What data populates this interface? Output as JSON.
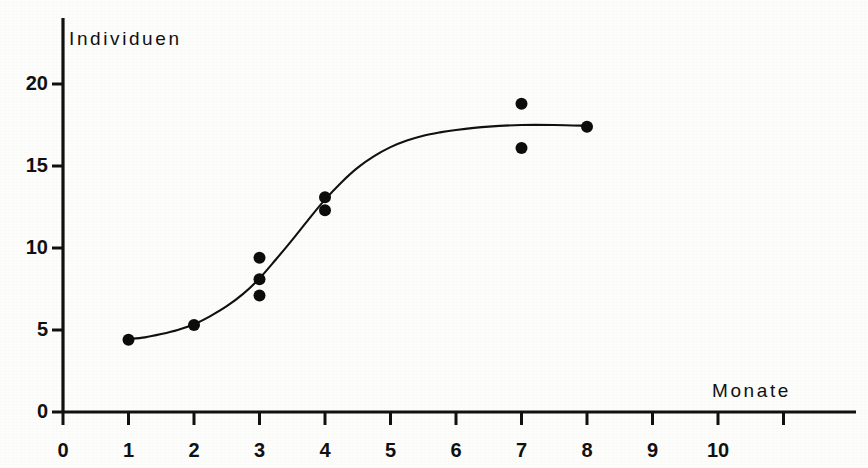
{
  "chart_data": {
    "type": "scatter",
    "title": "",
    "xlabel": "Monate",
    "ylabel": "Individuen",
    "xlim": [
      0,
      12.1
    ],
    "ylim": [
      0,
      22
    ],
    "grid": false,
    "legend": "none",
    "x_ticks": [
      0,
      1,
      2,
      3,
      4,
      5,
      6,
      7,
      8,
      9,
      10,
      11
    ],
    "x_tick_labels": [
      "0",
      "1",
      "2",
      "3",
      "4",
      "5",
      "6",
      "7",
      "8",
      "9",
      "10",
      ""
    ],
    "y_ticks": [
      0,
      5,
      10,
      15,
      20
    ],
    "y_tick_labels": [
      "0",
      "5",
      "10",
      "15",
      "20"
    ],
    "points": [
      {
        "x": 1,
        "y": 4.4
      },
      {
        "x": 2,
        "y": 5.3
      },
      {
        "x": 3,
        "y": 9.4
      },
      {
        "x": 3,
        "y": 8.1
      },
      {
        "x": 3,
        "y": 7.1
      },
      {
        "x": 4,
        "y": 13.1
      },
      {
        "x": 4,
        "y": 12.3
      },
      {
        "x": 7,
        "y": 18.8
      },
      {
        "x": 7,
        "y": 16.1
      },
      {
        "x": 8,
        "y": 17.4
      }
    ],
    "fit_curve": {
      "name": "logistic-fit",
      "x_start": 1,
      "x_end": 8,
      "points": [
        {
          "x": 1.0,
          "y": 4.45
        },
        {
          "x": 1.25,
          "y": 4.55
        },
        {
          "x": 1.5,
          "y": 4.75
        },
        {
          "x": 1.75,
          "y": 5.0
        },
        {
          "x": 2.0,
          "y": 5.35
        },
        {
          "x": 2.25,
          "y": 5.85
        },
        {
          "x": 2.5,
          "y": 6.45
        },
        {
          "x": 2.75,
          "y": 7.2
        },
        {
          "x": 3.0,
          "y": 8.15
        },
        {
          "x": 3.25,
          "y": 9.3
        },
        {
          "x": 3.5,
          "y": 10.5
        },
        {
          "x": 3.75,
          "y": 11.75
        },
        {
          "x": 4.0,
          "y": 12.95
        },
        {
          "x": 4.25,
          "y": 14.0
        },
        {
          "x": 4.5,
          "y": 14.9
        },
        {
          "x": 4.75,
          "y": 15.6
        },
        {
          "x": 5.0,
          "y": 16.15
        },
        {
          "x": 5.25,
          "y": 16.55
        },
        {
          "x": 5.5,
          "y": 16.85
        },
        {
          "x": 5.75,
          "y": 17.05
        },
        {
          "x": 6.0,
          "y": 17.2
        },
        {
          "x": 6.5,
          "y": 17.4
        },
        {
          "x": 7.0,
          "y": 17.5
        },
        {
          "x": 7.5,
          "y": 17.5
        },
        {
          "x": 8.0,
          "y": 17.45
        }
      ]
    },
    "colors": {
      "axis": "#111111",
      "curve": "#111111",
      "marker": "#0d0d0d",
      "background": "#fdfdfc"
    },
    "marker_radius": 6
  },
  "figure": {
    "y_axis_title": "Individuen",
    "x_axis_title": "Monate"
  }
}
